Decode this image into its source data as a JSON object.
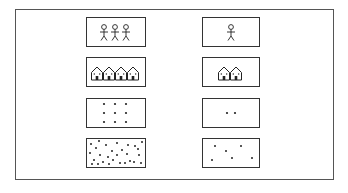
{
  "diagram": {
    "columns": [
      {
        "id": "high-density",
        "rows": [
          {
            "type": "people",
            "count": 3
          },
          {
            "type": "houses",
            "count": 4
          },
          {
            "type": "dots-grid",
            "count": 9
          },
          {
            "type": "dots-scatter",
            "count": 28
          }
        ]
      },
      {
        "id": "low-density",
        "rows": [
          {
            "type": "people",
            "count": 1
          },
          {
            "type": "houses",
            "count": 2
          },
          {
            "type": "dots-grid",
            "count": 2
          },
          {
            "type": "dots-scatter",
            "count": 6
          }
        ]
      }
    ],
    "colors": {
      "stroke": "#222222",
      "frame": "#555555",
      "background": "#ffffff"
    }
  }
}
